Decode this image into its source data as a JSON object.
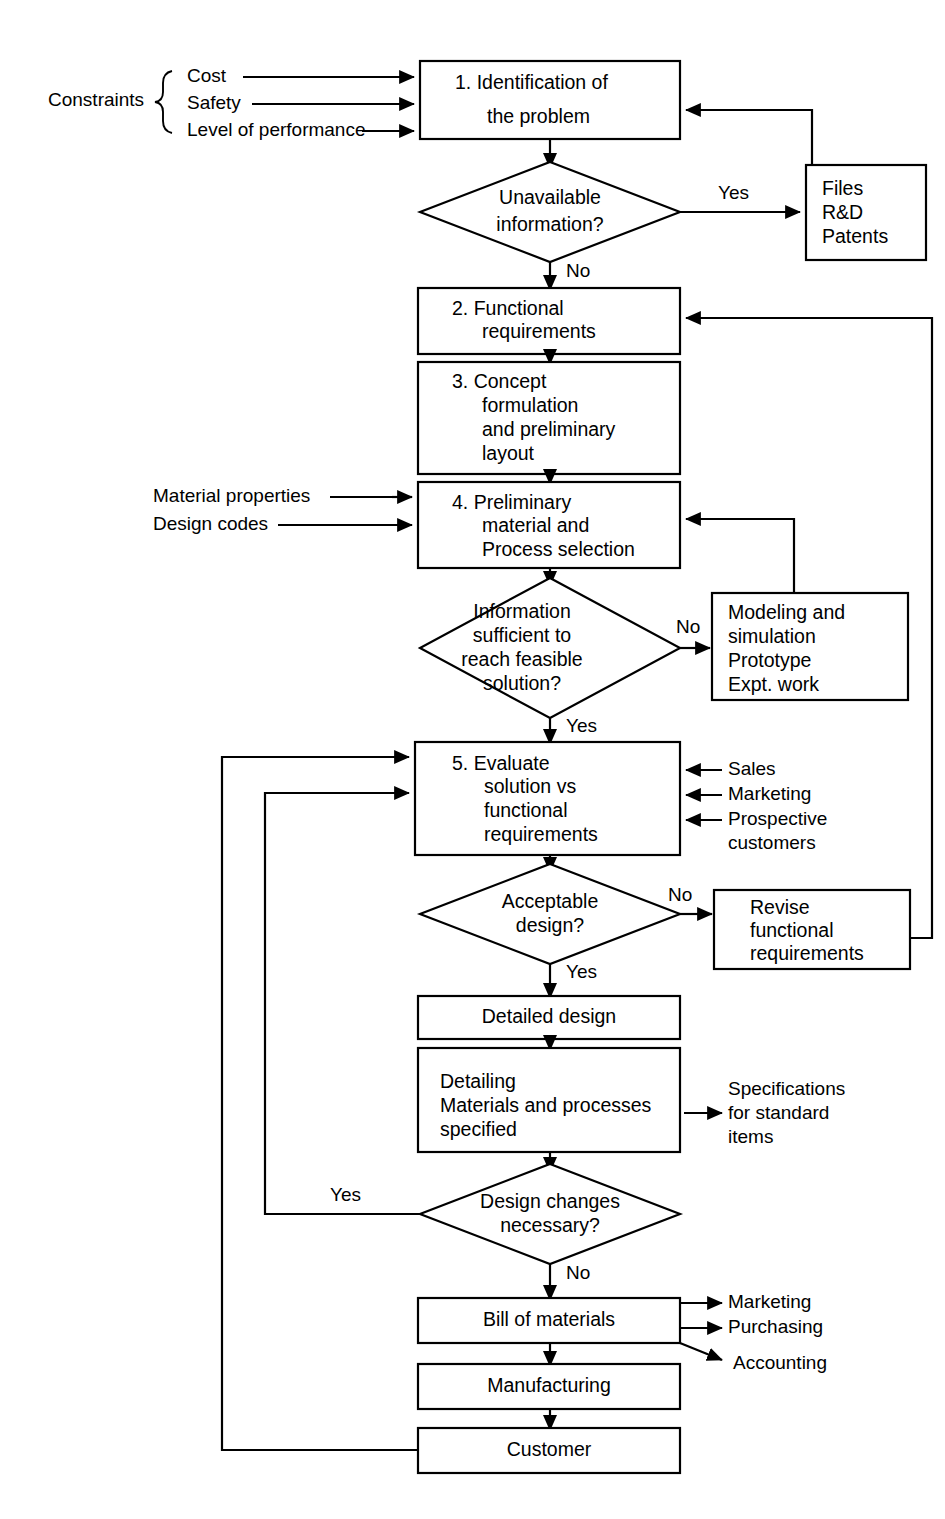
{
  "diagram": {
    "constraints": {
      "group_label": "Constraints",
      "items": [
        "Cost",
        "Safety",
        "Level of performance"
      ]
    },
    "inputs_step4": [
      "Material properties",
      "Design codes"
    ],
    "inputs_step5": [
      "Sales",
      "Marketing",
      "Prospective",
      "customers"
    ],
    "outputs_detailing": [
      "Specifications",
      "for standard",
      "items"
    ],
    "outputs_bom": [
      "Marketing",
      "Purchasing",
      "Accounting"
    ],
    "nodes": {
      "step1": {
        "l1": "1.  Identification of",
        "l2": "the problem"
      },
      "d1": {
        "l1": "Unavailable",
        "l2": "information?"
      },
      "files": {
        "l1": "Files",
        "l2": "R&D",
        "l3": "Patents"
      },
      "step2": {
        "l1": "2.  Functional",
        "l2": "requirements"
      },
      "step3": {
        "l1": "3.  Concept",
        "l2": "formulation",
        "l3": "and preliminary",
        "l4": "layout"
      },
      "step4": {
        "l1": "4.  Preliminary",
        "l2": "material and",
        "l3": "Process selection"
      },
      "d2": {
        "l1": "Information",
        "l2": "sufficient to",
        "l3": "reach feasible",
        "l4": "solution?"
      },
      "modeling": {
        "l1": "Modeling and",
        "l2": "simulation",
        "l3": "Prototype",
        "l4": "Expt. work"
      },
      "step5": {
        "l1": "5.  Evaluate",
        "l2": "solution vs",
        "l3": "functional",
        "l4": "requirements"
      },
      "d3": {
        "l1": "Acceptable",
        "l2": "design?"
      },
      "revise": {
        "l1": "Revise",
        "l2": "functional",
        "l3": "requirements"
      },
      "detailed": {
        "l1": "Detailed design"
      },
      "detailing": {
        "l1": "Detailing",
        "l2": "Materials and processes",
        "l3": "specified"
      },
      "d4": {
        "l1": "Design changes",
        "l2": "necessary?"
      },
      "bom": {
        "l1": "Bill of materials"
      },
      "mfg": {
        "l1": "Manufacturing"
      },
      "cust": {
        "l1": "Customer"
      }
    },
    "edge_labels": {
      "d1_yes": "Yes",
      "d1_no": "No",
      "d2_no": "No",
      "d2_yes": "Yes",
      "d3_no": "No",
      "d3_yes": "Yes",
      "d4_yes": "Yes",
      "d4_no": "No"
    },
    "colors": {
      "stroke": "#000000",
      "fill": "#ffffff",
      "text": "#000000"
    }
  }
}
